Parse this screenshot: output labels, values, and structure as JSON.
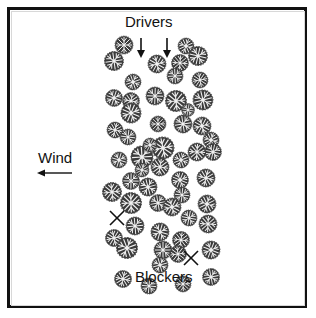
{
  "labels": {
    "drivers": "Drivers",
    "wind": "Wind",
    "blockers": "Blockers"
  },
  "colors": {
    "ink": "#111111",
    "tree_dark": "#2a2a2a",
    "tree_light": "#f2f2f2",
    "background": "#ffffff"
  },
  "wind_direction": "left",
  "drivers_count": 2,
  "blockers_count": 2,
  "tree_count": 70
}
